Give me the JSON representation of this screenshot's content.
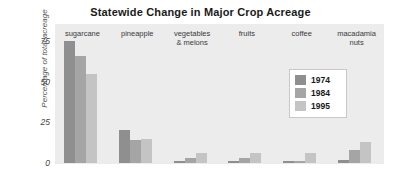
{
  "chart_data": {
    "type": "bar",
    "title": "Statewide Change in Major Crop Acreage",
    "xlabel": "",
    "ylabel": "Percentage of total acreage",
    "categories": [
      "sugarcane",
      "pineapple",
      "vegetables\n& melons",
      "fruits",
      "coffee",
      "macadamia\nnuts"
    ],
    "series": [
      {
        "name": "1974",
        "color": "#8f8f8f",
        "values": [
          75,
          20,
          1,
          1,
          1,
          2
        ]
      },
      {
        "name": "1984",
        "color": "#a5a5a5",
        "values": [
          66,
          14,
          3,
          3,
          1,
          8
        ]
      },
      {
        "name": "1995",
        "color": "#c4c4c4",
        "values": [
          55,
          15,
          6,
          6,
          6,
          13
        ]
      }
    ],
    "ylim": [
      0,
      80
    ],
    "yticks": [
      0,
      25,
      50,
      75
    ],
    "ytick_labels": [
      "0",
      "25",
      "50",
      "75"
    ],
    "grid": false,
    "legend_position": "center-right",
    "panel_color": "#ececec",
    "background_color": "#ffffff"
  },
  "legend": {
    "entries": [
      "1974",
      "1984",
      "1995"
    ]
  }
}
